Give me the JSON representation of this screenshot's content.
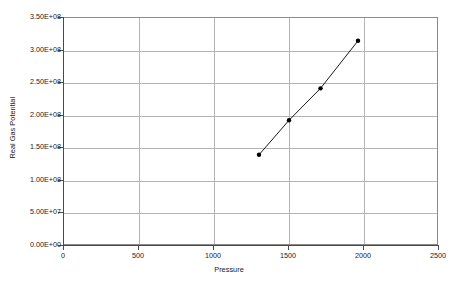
{
  "chart_data": {
    "type": "line",
    "title": "",
    "subtitle": "",
    "xlabel": "Pressure",
    "ylabel": "Real Gas Potential",
    "xlim": [
      0,
      2500
    ],
    "ylim": [
      0,
      350000000
    ],
    "grid": true,
    "legend": false,
    "legend_position": "none",
    "marker": "filled-circle",
    "line_color": "#000000",
    "marker_color": "#000000",
    "x": [
      1300,
      1500,
      1710,
      1960
    ],
    "y": [
      140000000,
      193000000,
      242000000,
      315000000
    ],
    "points": [
      {
        "x": 1300,
        "y": 140000000
      },
      {
        "x": 1500,
        "y": 193000000
      },
      {
        "x": 1710,
        "y": 242000000
      },
      {
        "x": 1960,
        "y": 315000000
      }
    ],
    "series": [
      {
        "name": "Real Gas Potential",
        "x": [
          1300,
          1500,
          1710,
          1960
        ],
        "values": [
          140000000,
          193000000,
          242000000,
          315000000
        ]
      }
    ],
    "xticks": [
      0,
      500,
      1000,
      1500,
      2000,
      2500
    ],
    "xtick_labels": [
      "0",
      "500",
      "1000",
      "1500",
      "2000",
      "2500"
    ],
    "yticks": [
      0,
      50000000,
      100000000,
      150000000,
      200000000,
      250000000,
      300000000,
      350000000
    ],
    "ytick_labels": [
      "0.00E+00",
      "5.00E+07",
      "1.00E+08",
      "1.50E+08",
      "2.00E+08",
      "2.50E+08",
      "3.00E+08",
      "3.50E+08"
    ]
  },
  "colors": {
    "background": "#ffffff",
    "gridline": "#b4b4b4",
    "axis": "#4a4a4a",
    "frame": "#8a8a8a",
    "text": "#1a1a1a",
    "series": "#000000"
  }
}
